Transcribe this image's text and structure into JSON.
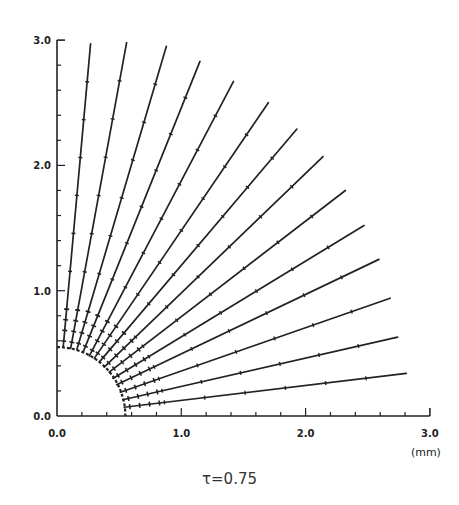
{
  "chart_data": {
    "type": "line",
    "title": "",
    "caption": "τ=0.75",
    "xlabel": "(mm)",
    "ylabel": "",
    "xlim": [
      0.0,
      3.0
    ],
    "ylim": [
      0.0,
      3.0
    ],
    "x_tick_labels": [
      "0.0",
      "1.0",
      "2.0",
      "3.0"
    ],
    "y_tick_labels": [
      "0.0",
      "1.0",
      "2.0",
      "3.0"
    ],
    "grid": false,
    "legend": null,
    "inner_boundary_radius_mm": 0.55,
    "series": [
      {
        "name": "trajectory-1",
        "start": [
          0.05,
          0.55
        ],
        "end": [
          0.27,
          2.97
        ]
      },
      {
        "name": "trajectory-2",
        "start": [
          0.11,
          0.54
        ],
        "end": [
          0.56,
          2.98
        ]
      },
      {
        "name": "trajectory-3",
        "start": [
          0.16,
          0.53
        ],
        "end": [
          0.88,
          2.95
        ]
      },
      {
        "name": "trajectory-4",
        "start": [
          0.21,
          0.51
        ],
        "end": [
          1.15,
          2.83
        ]
      },
      {
        "name": "trajectory-5",
        "start": [
          0.26,
          0.48
        ],
        "end": [
          1.42,
          2.67
        ]
      },
      {
        "name": "trajectory-6",
        "start": [
          0.3,
          0.46
        ],
        "end": [
          1.7,
          2.5
        ]
      },
      {
        "name": "trajectory-7",
        "start": [
          0.34,
          0.43
        ],
        "end": [
          1.93,
          2.29
        ]
      },
      {
        "name": "trajectory-8",
        "start": [
          0.38,
          0.39
        ],
        "end": [
          2.14,
          2.07
        ]
      },
      {
        "name": "trajectory-9",
        "start": [
          0.42,
          0.35
        ],
        "end": [
          2.32,
          1.8
        ]
      },
      {
        "name": "trajectory-10",
        "start": [
          0.45,
          0.3
        ],
        "end": [
          2.47,
          1.52
        ]
      },
      {
        "name": "trajectory-11",
        "start": [
          0.48,
          0.25
        ],
        "end": [
          2.59,
          1.25
        ]
      },
      {
        "name": "trajectory-12",
        "start": [
          0.51,
          0.19
        ],
        "end": [
          2.68,
          0.94
        ]
      },
      {
        "name": "trajectory-13",
        "start": [
          0.53,
          0.13
        ],
        "end": [
          2.74,
          0.63
        ]
      },
      {
        "name": "trajectory-14",
        "start": [
          0.54,
          0.07
        ],
        "end": [
          2.81,
          0.34
        ]
      }
    ]
  }
}
